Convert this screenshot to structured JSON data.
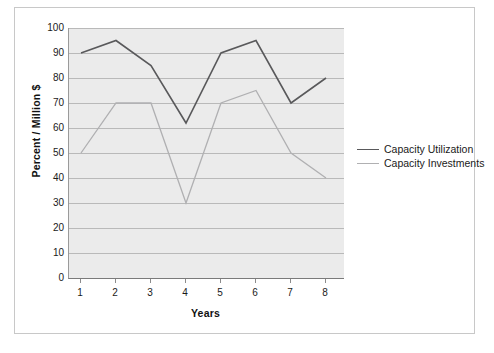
{
  "chart_data": {
    "type": "line",
    "title": "",
    "xlabel": "Years",
    "ylabel": "Percent / Million $",
    "x": [
      1,
      2,
      3,
      4,
      5,
      6,
      7,
      8
    ],
    "categories": [
      "1",
      "2",
      "3",
      "4",
      "5",
      "6",
      "7",
      "8"
    ],
    "xtick_labels": [
      "1",
      "2",
      "3",
      "4",
      "5",
      "6",
      "7",
      "8"
    ],
    "ytick_labels": [
      "100",
      "90",
      "80",
      "70",
      "60",
      "50",
      "40",
      "30",
      "20",
      "10",
      "0"
    ],
    "yticks": [
      100,
      90,
      80,
      70,
      60,
      50,
      40,
      30,
      20,
      10,
      0
    ],
    "ylim": [
      0,
      100
    ],
    "xlim": [
      1,
      8
    ],
    "grid": "horizontal",
    "legend_position": "right",
    "series": [
      {
        "name": "Capacity Utilization",
        "color": "#59595b",
        "values": [
          90,
          95,
          85,
          62,
          90,
          95,
          70,
          80
        ]
      },
      {
        "name": "Capacity Investments",
        "color": "#b0b0b2",
        "values": [
          50,
          70,
          70,
          30,
          70,
          75,
          50,
          40
        ]
      }
    ]
  },
  "colors": {
    "plot_background": "#ebebeb",
    "gridline": "#b9b9b9",
    "axis": "#7a7a7a",
    "frame": "#c8c8c8",
    "text": "#1a1a1a"
  }
}
